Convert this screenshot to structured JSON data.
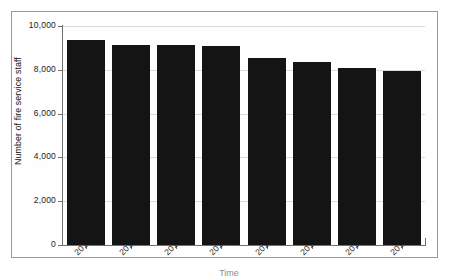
{
  "chart_data": {
    "type": "bar",
    "title": "",
    "xlabel": "Time",
    "ylabel": "Number of fire service staff",
    "categories": [
      "2010",
      "2011",
      "2012",
      "2013",
      "2014",
      "2015",
      "2016",
      "2017"
    ],
    "values": [
      9350,
      9130,
      9120,
      9080,
      8530,
      8350,
      8080,
      7940
    ],
    "series": [
      {
        "name": "Number of fire service staff",
        "values": [
          9350,
          9130,
          9120,
          9080,
          8530,
          8350,
          8080,
          7940
        ]
      }
    ],
    "ylim": [
      0,
      10000
    ],
    "ytick_labels": [
      "0",
      "2,000",
      "4,000",
      "6,000",
      "8,000",
      "10,000"
    ],
    "ytick_values": [
      0,
      2000,
      4000,
      6000,
      8000,
      10000
    ],
    "xtick_labels": [
      "2010",
      "2011",
      "2012",
      "2013",
      "2014",
      "2015",
      "2016",
      "2017"
    ],
    "grid": true,
    "grid_axis": "y",
    "legend": false,
    "legend_position": "none",
    "bar_color": "#141414",
    "axis_color": "#707070",
    "grid_color": "#dcdcdc",
    "xtick_label_rotation": -45,
    "annotations": []
  }
}
